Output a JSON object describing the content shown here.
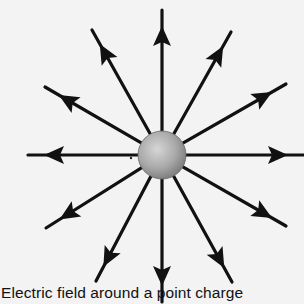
{
  "diagram": {
    "title": "Electric field around a point charge",
    "caption": "Electric field around a point charge",
    "colors": {
      "background": "#f3f3f3",
      "field_line": "#111111",
      "charge_fill_light": "#d8d8d8",
      "charge_fill_dark": "#8a8a8a",
      "caption_text": "#111111"
    },
    "charge": {
      "label": "point charge",
      "center": [
        162,
        155
      ],
      "radius": 24
    },
    "field_lines": [
      {
        "name": "up",
        "end": [
          162,
          10
        ]
      },
      {
        "name": "up-right-steep",
        "end": [
          231,
          32
        ]
      },
      {
        "name": "up-right-shallow",
        "end": [
          286,
          84
        ]
      },
      {
        "name": "right",
        "end": [
          304,
          155
        ]
      },
      {
        "name": "down-right-shallow",
        "end": [
          286,
          226
        ]
      },
      {
        "name": "down-right-steep",
        "end": [
          232,
          282
        ]
      },
      {
        "name": "down",
        "end": [
          162,
          302
        ]
      },
      {
        "name": "down-left-steep",
        "end": [
          96,
          281
        ]
      },
      {
        "name": "down-left-shallow",
        "end": [
          46,
          228
        ]
      },
      {
        "name": "left",
        "end": [
          28,
          155
        ]
      },
      {
        "name": "up-left-shallow",
        "end": [
          45,
          87
        ]
      },
      {
        "name": "up-left-steep",
        "end": [
          92,
          30
        ]
      }
    ],
    "arrow_direction": "outward"
  }
}
